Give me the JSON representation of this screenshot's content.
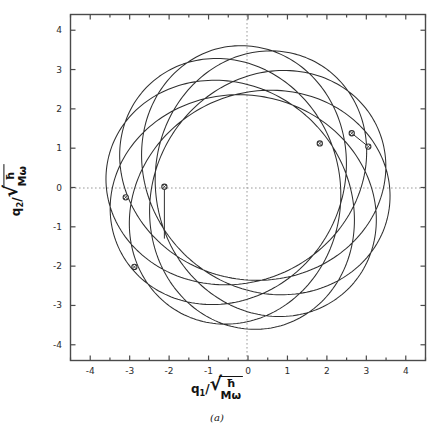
{
  "figure": {
    "caption": "(a)",
    "background_color": "#ffffff",
    "curve_color": "#2f2f2f",
    "axis_color": "#4a4a4a",
    "grid_color": "#9a9a9a"
  },
  "axes": {
    "x": {
      "label_text": "q1/√(ħ/Mω)",
      "symbol": "q",
      "subscript": "1",
      "divider": "/",
      "radicand_numerator": "ħ",
      "radicand_denominator": "Mω",
      "ticks": [
        "-4",
        "-3",
        "-2",
        "-1",
        "0",
        "1",
        "2",
        "3",
        "4"
      ],
      "tick_values": [
        -4,
        -3,
        -2,
        -1,
        0,
        1,
        2,
        3,
        4
      ],
      "range": [
        -4.5,
        4.5
      ]
    },
    "y": {
      "label_text": "q2/√(ħ/Mω)",
      "symbol": "q",
      "subscript": "2",
      "divider": "/",
      "radicand_numerator": "ħ",
      "radicand_denominator": "Mω",
      "ticks": [
        "-4",
        "-3",
        "-2",
        "-1",
        "0",
        "1",
        "2",
        "3",
        "4"
      ],
      "tick_values": [
        -4,
        -3,
        -2,
        -1,
        0,
        1,
        2,
        3,
        4
      ],
      "range": [
        -4.4,
        4.4
      ]
    },
    "zero_gridlines": true
  },
  "chart_data": {
    "type": "line",
    "title": "",
    "subtitle": "",
    "xlabel": "q1/sqrt(hbar/(M omega))",
    "ylabel": "q2/sqrt(hbar/(M omega))",
    "xlim": [
      -4.5,
      4.5
    ],
    "ylim": [
      -4.4,
      4.4
    ],
    "grid": "zero-axes-only, dotted",
    "legend": "none",
    "series": [
      {
        "name": "rosette-orbit",
        "kind": "parametric-closed-curve",
        "parametric": {
          "a": 3.62,
          "b": 2.34,
          "precession_lobes": 5,
          "precession_k": 2.5,
          "phase_deg": 98,
          "formula": "r(t) = a*cos(t)*[cos(w t), sin(w t)] + b*sin(t)*[-sin(w t), cos(w t)] , w = 0.4"
        },
        "extents": {
          "x_min": -3.45,
          "x_max": 3.55,
          "y_min": -3.45,
          "y_max": 3.65
        }
      }
    ],
    "markers": [
      {
        "label": "p1",
        "x": -3.1,
        "y": -0.25,
        "has_spoke": false
      },
      {
        "label": "p2",
        "x": -2.88,
        "y": -2.02,
        "has_spoke": false
      },
      {
        "label": "p3",
        "x": -2.12,
        "y": 0.02,
        "has_spoke": true,
        "spoke_to_x": -2.12,
        "spoke_to_y": -1.3
      },
      {
        "label": "p4",
        "x": 1.82,
        "y": 1.12,
        "has_spoke": false
      },
      {
        "label": "p5",
        "x": 2.63,
        "y": 1.38,
        "has_spoke": true,
        "spoke_to_x": 3.05,
        "spoke_to_y": 1.04
      },
      {
        "label": "p6",
        "x": 3.05,
        "y": 1.04,
        "has_spoke": false
      }
    ],
    "marker_style": {
      "shape": "circle-open",
      "radius_px": 2.6,
      "edge_color": "#2f2f2f",
      "face_color": "#ffffff"
    }
  }
}
